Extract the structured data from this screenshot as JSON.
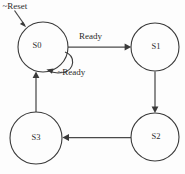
{
  "diagram": {
    "background_color": "#fdfdfd",
    "line_color": "#3a3a3a",
    "text_color": "#2e2e2e",
    "states": [
      {
        "id": "S0",
        "label": "S0",
        "cx": 43,
        "cy": 47,
        "r": 25
      },
      {
        "id": "S1",
        "label": "S1",
        "cx": 155,
        "cy": 47,
        "r": 24
      },
      {
        "id": "S2",
        "label": "S2",
        "cx": 155,
        "cy": 137,
        "r": 24
      },
      {
        "id": "S3",
        "label": "S3",
        "cx": 36,
        "cy": 138,
        "r": 26
      }
    ],
    "transitions": [
      {
        "id": "reset",
        "label": "~Reset",
        "from": "start",
        "to": "S0",
        "kind": "entry"
      },
      {
        "id": "s0-s1",
        "label": "Ready",
        "from": "S0",
        "to": "S1",
        "kind": "straight"
      },
      {
        "id": "s0-s0",
        "label": "~Ready",
        "from": "S0",
        "to": "S0",
        "kind": "self-loop"
      },
      {
        "id": "s1-s2",
        "label": "",
        "from": "S1",
        "to": "S2",
        "kind": "straight"
      },
      {
        "id": "s2-s3",
        "label": "",
        "from": "S2",
        "to": "S3",
        "kind": "straight"
      },
      {
        "id": "s3-s0",
        "label": "",
        "from": "S3",
        "to": "S0",
        "kind": "straight"
      }
    ],
    "labels": {
      "reset": "~Reset",
      "ready": "Ready",
      "not_ready": "~Ready",
      "s0": "S0",
      "s1": "S1",
      "s2": "S2",
      "s3": "S3"
    }
  }
}
